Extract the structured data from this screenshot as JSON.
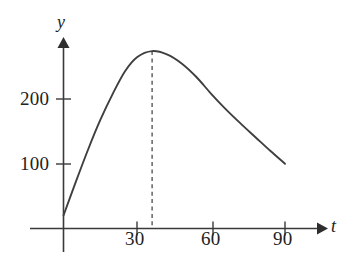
{
  "chart_data": {
    "type": "line",
    "title": "",
    "subtitle": "",
    "xlabel": "t",
    "ylabel": "y",
    "xlim": [
      0,
      100
    ],
    "ylim": [
      0,
      300
    ],
    "grid": false,
    "legend": null,
    "x_ticks": [
      30,
      60,
      90
    ],
    "x_tick_labels": [
      "30",
      "60",
      "90"
    ],
    "y_ticks": [
      100,
      200
    ],
    "y_tick_labels": [
      "100",
      "200"
    ],
    "annotations": [
      {
        "name": "peak-dashed-line",
        "style": "dashed-vertical",
        "x": 36,
        "y_from": 0,
        "y_to": 274,
        "label": ""
      }
    ],
    "series": [
      {
        "name": "curve",
        "style": "solid",
        "color": "#3f3f3f",
        "x": [
          0,
          5,
          10,
          15,
          20,
          25,
          30,
          36,
          42,
          48,
          54,
          60,
          66,
          72,
          78,
          84,
          90
        ],
        "y": [
          20,
          72,
          122,
          168,
          208,
          243,
          265,
          274,
          269,
          255,
          234,
          208,
          184,
          162,
          141,
          120,
          100
        ]
      }
    ]
  },
  "axes": {
    "y_axis_label": "y",
    "x_axis_label": "t",
    "y_tick_200": "200",
    "y_tick_100": "100",
    "x_tick_30": "30",
    "x_tick_60": "60",
    "x_tick_90": "90"
  },
  "colors": {
    "background": "#ffffff",
    "axis": "#3a3a3a",
    "curve": "#3f3f3f",
    "dashed": "#4a4a4a",
    "text": "#222222"
  }
}
